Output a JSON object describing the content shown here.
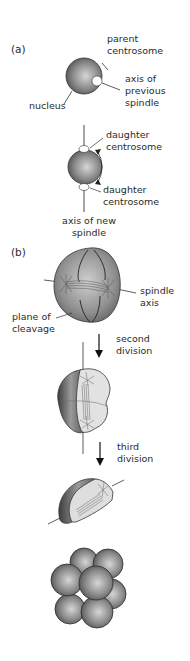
{
  "panel_a": {
    "label": "(a)",
    "step1": {
      "parent_centrosome": [
        "parent",
        "centrosome"
      ],
      "axis_previous": [
        "axis of",
        "previous",
        "spindle"
      ],
      "nucleus": "nucleus"
    },
    "step2": {
      "daughter_top": [
        "daughter",
        "centrosome"
      ],
      "daughter_bottom": [
        "daughter",
        "centrosome"
      ],
      "axis_new": [
        "axis of new",
        "spindle"
      ]
    }
  },
  "panel_b": {
    "label": "(b)",
    "spindle_axis": [
      "spindle",
      "axis"
    ],
    "plane_of_cleavage": [
      "plane of",
      "cleavage"
    ],
    "second_division": [
      "second",
      "division"
    ],
    "third_division": [
      "third",
      "division"
    ]
  },
  "colors": {
    "cell_dark": "#5a5a5a",
    "cell_mid": "#8c8c8c",
    "cell_light": "#d8d8d8",
    "line": "#333333"
  }
}
